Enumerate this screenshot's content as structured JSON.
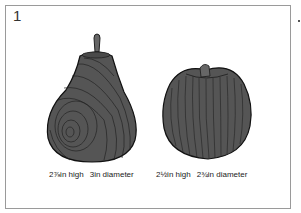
{
  "figure": {
    "number": "1",
    "items": [
      {
        "name": "pear",
        "height": "2⅞in high",
        "diameter": "3in diameter"
      },
      {
        "name": "apple",
        "height": "2½in high",
        "diameter": "2¾in diameter"
      }
    ]
  },
  "colors": {
    "fill": "#555555",
    "grain": "#222222",
    "frame": "#9a9a9a"
  }
}
